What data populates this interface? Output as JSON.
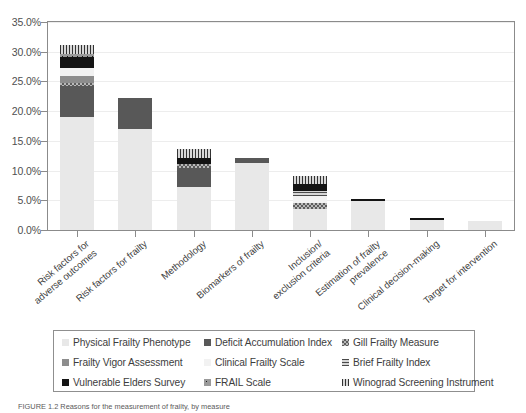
{
  "chart_data": {
    "type": "bar",
    "subtype": "stacked-bar",
    "title": "",
    "xlabel": "",
    "ylabel": "",
    "ylim": [
      0,
      35
    ],
    "ytick_values": [
      0,
      5,
      10,
      15,
      20,
      25,
      30,
      35
    ],
    "ytick_labels": [
      "0.0%",
      "5.0%",
      "10.0%",
      "15.0%",
      "20.0%",
      "25.0%",
      "30.0%",
      "35.0%"
    ],
    "grid": true,
    "legend_position": "below",
    "categories": [
      "Risk factors for\nadverse outcomes",
      "Risk factors for frailty",
      "Methodology",
      "Biomarkers of frailty",
      "Inclusion/\nexclusion criteria",
      "Estimation of frailty\nprevalence",
      "Clinical decision-making",
      "Target for intervention"
    ],
    "series": [
      {
        "name": "Physical Frailty Phenotype",
        "key": "pfp",
        "color": "#e8e8e8",
        "pattern": "solid",
        "values": [
          19.0,
          17.0,
          7.3,
          11.3,
          3.6,
          4.8,
          1.7,
          1.5
        ]
      },
      {
        "name": "Deficit Accumulation Index",
        "key": "dai",
        "color": "#585858",
        "pattern": "solid",
        "values": [
          5.2,
          5.3,
          3.2,
          0.8,
          0.0,
          0.0,
          0.0,
          0.0
        ]
      },
      {
        "name": "Gill Frailty Measure",
        "key": "gfm",
        "color": "#5d5d5d",
        "pattern": "checker",
        "values": [
          0.5,
          0.0,
          0.6,
          0.0,
          0.9,
          0.0,
          0.0,
          0.0
        ]
      },
      {
        "name": "Frailty Vigor Assessment",
        "key": "fva",
        "color": "#8d8d8d",
        "pattern": "solid",
        "values": [
          1.2,
          0.0,
          0.0,
          0.0,
          0.0,
          0.0,
          0.0,
          0.0
        ]
      },
      {
        "name": "Clinical Frailty Scale",
        "key": "cfs",
        "color": "#f2f2f2",
        "pattern": "solid",
        "values": [
          1.3,
          0.0,
          0.0,
          0.0,
          1.2,
          0.0,
          0.0,
          0.0
        ]
      },
      {
        "name": "Brief Frailty Index",
        "key": "bfi",
        "color": "#4a4a4a",
        "pattern": "h-stripe",
        "values": [
          0.0,
          0.0,
          0.0,
          0.0,
          0.8,
          0.0,
          0.0,
          0.0
        ]
      },
      {
        "name": "Vulnerable Elders Survey",
        "key": "ves",
        "color": "#141414",
        "pattern": "solid",
        "values": [
          1.9,
          0.0,
          1.0,
          0.0,
          1.3,
          0.5,
          0.4,
          0.0
        ]
      },
      {
        "name": "FRAIL Scale",
        "key": "frail",
        "color": "#9a9a9a",
        "pattern": "dots",
        "values": [
          0.6,
          0.0,
          0.0,
          0.0,
          0.0,
          0.0,
          0.0,
          0.0
        ]
      },
      {
        "name": "Winograd Screening Instrument",
        "key": "wsi",
        "color": "#333333",
        "pattern": "v-stripe",
        "values": [
          1.4,
          0.0,
          1.6,
          0.0,
          1.3,
          0.0,
          0.0,
          0.0
        ]
      }
    ],
    "totals": [
      31.1,
      22.3,
      13.7,
      12.1,
      9.1,
      5.3,
      2.1,
      1.5
    ]
  },
  "legend": {
    "entries": [
      {
        "label": "Physical Frailty Phenotype",
        "key": "pfp"
      },
      {
        "label": "Deficit Accumulation Index",
        "key": "dai"
      },
      {
        "label": "Gill Frailty Measure",
        "key": "gfm"
      },
      {
        "label": "Frailty Vigor Assessment",
        "key": "fva"
      },
      {
        "label": "Clinical Frailty Scale",
        "key": "cfs"
      },
      {
        "label": "Brief Frailty Index",
        "key": "bfi"
      },
      {
        "label": "Vulnerable Elders Survey",
        "key": "ves"
      },
      {
        "label": "FRAIL Scale",
        "key": "frail"
      },
      {
        "label": "Winograd Screening Instrument",
        "key": "wsi"
      }
    ]
  },
  "caption": {
    "text": "FIGURE 1.2  Reasons for the measurement of frailty, by measure"
  }
}
